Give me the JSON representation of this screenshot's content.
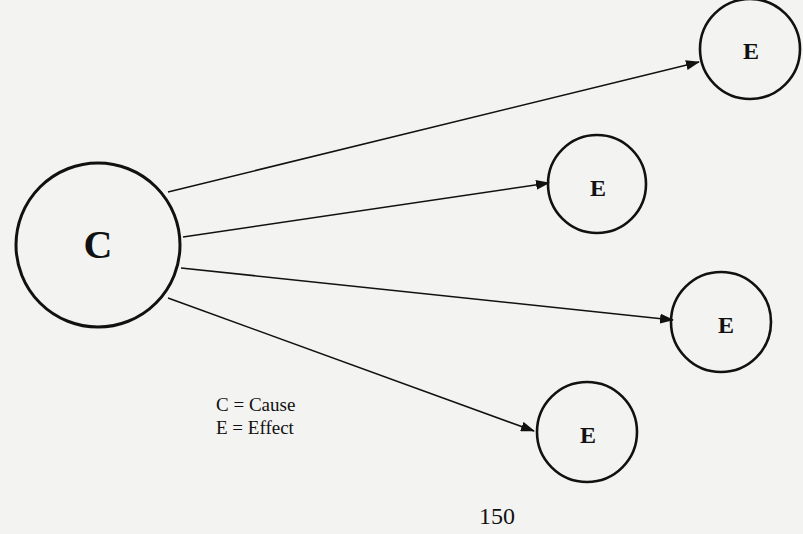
{
  "diagram": {
    "cause_node": {
      "label": "C",
      "cx": 98,
      "cy": 245,
      "r": 82
    },
    "effect_nodes": [
      {
        "label": "E",
        "cx": 750,
        "cy": 49,
        "r": 50
      },
      {
        "label": "E",
        "cx": 597,
        "cy": 184,
        "r": 49
      },
      {
        "label": "E",
        "cx": 721,
        "cy": 322,
        "r": 50
      },
      {
        "label": "E",
        "cx": 587,
        "cy": 432,
        "r": 50
      }
    ],
    "arrows": [
      {
        "from": "C",
        "to": "E1",
        "x1": 168,
        "y1": 192,
        "x2": 699,
        "y2": 62
      },
      {
        "from": "C",
        "to": "E2",
        "x1": 183,
        "y1": 237,
        "x2": 549,
        "y2": 183
      },
      {
        "from": "C",
        "to": "E3",
        "x1": 181,
        "y1": 268,
        "x2": 673,
        "y2": 320
      },
      {
        "from": "C",
        "to": "E4",
        "x1": 168,
        "y1": 298,
        "x2": 534,
        "y2": 431
      }
    ],
    "colors": {
      "stroke": "#111111",
      "background": "#f3f3f1"
    }
  },
  "legend": {
    "line1": "C = Cause",
    "line2": "E = Effect"
  },
  "page_number": "150"
}
